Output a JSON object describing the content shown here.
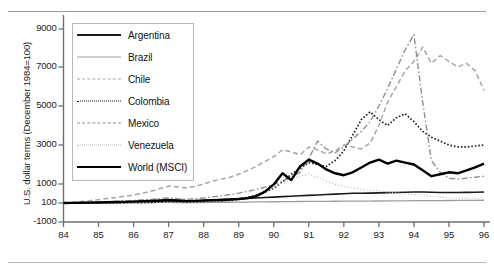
{
  "chart_data": {
    "type": "line",
    "title": "",
    "xlabel": "",
    "ylabel": "U.S. dollar terms (December 1984=100)",
    "xlim": [
      84,
      96
    ],
    "ylim": [
      -1000,
      9800
    ],
    "grid": false,
    "legend_position": "upper-left-inside",
    "xticks": [
      "84",
      "85",
      "86",
      "87",
      "88",
      "89",
      "90",
      "91",
      "92",
      "93",
      "94",
      "95",
      "96"
    ],
    "yticks": [
      "9000",
      "7000",
      "5000",
      "3000",
      "1000",
      "100",
      "-1000"
    ],
    "ytick_values": [
      9000,
      7000,
      5000,
      3000,
      1000,
      100,
      -1000
    ],
    "x": [
      84,
      84.25,
      84.5,
      84.75,
      85,
      85.25,
      85.5,
      85.75,
      86,
      86.25,
      86.5,
      86.75,
      87,
      87.25,
      87.5,
      87.75,
      88,
      88.25,
      88.5,
      88.75,
      89,
      89.25,
      89.5,
      89.75,
      90,
      90.25,
      90.5,
      90.75,
      91,
      91.25,
      91.5,
      91.75,
      92,
      92.25,
      92.5,
      92.75,
      93,
      93.25,
      93.5,
      93.75,
      94,
      94.25,
      94.5,
      94.75,
      95,
      95.25,
      95.5,
      95.75,
      96
    ],
    "series": [
      {
        "name": "Argentina",
        "style": "solid",
        "color": "#1a1a1a",
        "width": 1.6,
        "values": [
          100,
          105,
          110,
          120,
          130,
          140,
          150,
          160,
          170,
          180,
          200,
          230,
          260,
          240,
          220,
          210,
          220,
          240,
          260,
          280,
          300,
          320,
          340,
          360,
          380,
          400,
          420,
          440,
          460,
          480,
          500,
          520,
          540,
          560,
          560,
          570,
          580,
          590,
          600,
          610,
          620,
          620,
          610,
          600,
          600,
          600,
          605,
          610,
          620
        ]
      },
      {
        "name": "Brazil",
        "style": "solid",
        "color": "#9d9d9d",
        "width": 1.3,
        "values": [
          100,
          100,
          100,
          100,
          100,
          105,
          110,
          110,
          115,
          115,
          120,
          125,
          125,
          120,
          118,
          118,
          120,
          125,
          130,
          135,
          140,
          145,
          150,
          155,
          160,
          165,
          168,
          170,
          175,
          178,
          180,
          182,
          185,
          188,
          190,
          192,
          195,
          198,
          200,
          205,
          208,
          210,
          212,
          215,
          218,
          220,
          222,
          225,
          230
        ]
      },
      {
        "name": "Chile",
        "style": "dashed",
        "color": "#a6a6a6",
        "width": 1.5,
        "values": [
          100,
          130,
          170,
          210,
          260,
          310,
          360,
          420,
          480,
          560,
          660,
          780,
          900,
          860,
          820,
          880,
          1000,
          1150,
          1250,
          1350,
          1500,
          1700,
          1900,
          2150,
          2400,
          2750,
          2650,
          2500,
          2900,
          2750,
          2550,
          2700,
          3000,
          2900,
          2800,
          3100,
          4000,
          5200,
          6000,
          6800,
          7300,
          8050,
          7200,
          7600,
          7300,
          7000,
          7200,
          6800,
          5800
        ]
      },
      {
        "name": "Colombia",
        "style": "dotted",
        "color": "#1f1f1f",
        "width": 1.7,
        "values": [
          100,
          100,
          100,
          100,
          100,
          100,
          105,
          110,
          115,
          120,
          130,
          140,
          150,
          145,
          140,
          150,
          165,
          180,
          200,
          230,
          280,
          360,
          480,
          620,
          800,
          1100,
          1500,
          1800,
          2100,
          2000,
          1900,
          2200,
          2700,
          3500,
          4300,
          4700,
          4300,
          4000,
          4400,
          4600,
          4200,
          3700,
          3400,
          3200,
          3000,
          2900,
          2900,
          2950,
          3000
        ]
      },
      {
        "name": "Mexico",
        "style": "dashdot",
        "color": "#8f8f8f",
        "width": 1.4,
        "values": [
          100,
          110,
          120,
          130,
          145,
          160,
          175,
          195,
          215,
          240,
          270,
          300,
          340,
          300,
          280,
          300,
          340,
          390,
          440,
          500,
          570,
          650,
          740,
          850,
          980,
          1150,
          1350,
          1600,
          2300,
          3200,
          2800,
          2600,
          2900,
          3300,
          3700,
          4200,
          5000,
          5900,
          6900,
          7900,
          8700,
          5200,
          2200,
          1600,
          1300,
          1250,
          1300,
          1350,
          1400
        ]
      },
      {
        "name": "Venezuela",
        "style": "fine-dotted",
        "color": "#bcbcbc",
        "width": 1.2,
        "values": [
          100,
          100,
          100,
          100,
          100,
          100,
          100,
          105,
          110,
          115,
          120,
          130,
          140,
          135,
          130,
          135,
          145,
          160,
          180,
          210,
          260,
          340,
          460,
          620,
          820,
          1050,
          1250,
          1400,
          1500,
          1350,
          1150,
          980,
          880,
          800,
          740,
          700,
          660,
          620,
          580,
          540,
          500,
          460,
          420,
          380,
          350,
          330,
          320,
          330,
          340
        ]
      },
      {
        "name": "World (MSCI)",
        "style": "solid-thick",
        "color": "#000000",
        "width": 2.4,
        "values": [
          100,
          105,
          110,
          118,
          126,
          135,
          145,
          155,
          165,
          180,
          195,
          210,
          225,
          205,
          190,
          200,
          215,
          230,
          245,
          265,
          290,
          330,
          420,
          640,
          980,
          1550,
          1200,
          1900,
          2250,
          2050,
          1750,
          1550,
          1450,
          1600,
          1850,
          2100,
          2250,
          2050,
          2200,
          2100,
          2000,
          1700,
          1400,
          1500,
          1600,
          1550,
          1700,
          1850,
          2050
        ]
      }
    ]
  },
  "legend": {
    "items": [
      {
        "label": "Argentina",
        "key": "argentina"
      },
      {
        "label": "Brazil",
        "key": "brazil"
      },
      {
        "label": "Chile",
        "key": "chile"
      },
      {
        "label": "Colombia",
        "key": "colombia"
      },
      {
        "label": "Mexico",
        "key": "mexico"
      },
      {
        "label": "Venezuela",
        "key": "venezuela"
      },
      {
        "label": "World (MSCI)",
        "key": "world"
      }
    ]
  },
  "axes": {
    "y_title": "U.S. dollar terms (December 1984=100)"
  }
}
